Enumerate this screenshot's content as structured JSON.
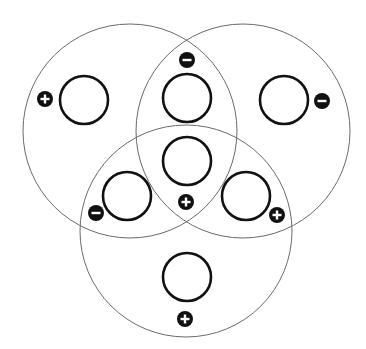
{
  "diagram": {
    "type": "three-set venn with node slots",
    "colors": {
      "big_circle": "#6a6a6a",
      "slot": "#111111",
      "badge": "#111111",
      "badge_glyph": "#ffffff"
    },
    "sets": [
      {
        "id": "set-top-left",
        "cx": 130,
        "cy": 131,
        "r": 107
      },
      {
        "id": "set-top-right",
        "cx": 243,
        "cy": 131,
        "r": 107
      },
      {
        "id": "set-bottom",
        "cx": 186,
        "cy": 231,
        "r": 106
      }
    ],
    "slots": [
      {
        "id": "slot-top-left-only",
        "cx": 84,
        "cy": 100,
        "sign": "+",
        "bx": 45,
        "by": 99
      },
      {
        "id": "slot-top-intersection",
        "cx": 187,
        "cy": 98,
        "sign": "-",
        "bx": 187,
        "by": 60
      },
      {
        "id": "slot-top-right-only",
        "cx": 284,
        "cy": 100,
        "sign": "-",
        "bx": 322,
        "by": 101
      },
      {
        "id": "slot-center",
        "cx": 187,
        "cy": 161,
        "sign": "+",
        "bx": 186,
        "by": 202
      },
      {
        "id": "slot-left-bottom-intersection",
        "cx": 127,
        "cy": 196,
        "sign": "-",
        "bx": 96,
        "by": 213
      },
      {
        "id": "slot-right-bottom-intersection",
        "cx": 246,
        "cy": 196,
        "sign": "+",
        "bx": 277,
        "by": 215
      },
      {
        "id": "slot-bottom-only",
        "cx": 187,
        "cy": 277,
        "sign": "+",
        "bx": 185,
        "by": 319
      }
    ]
  }
}
